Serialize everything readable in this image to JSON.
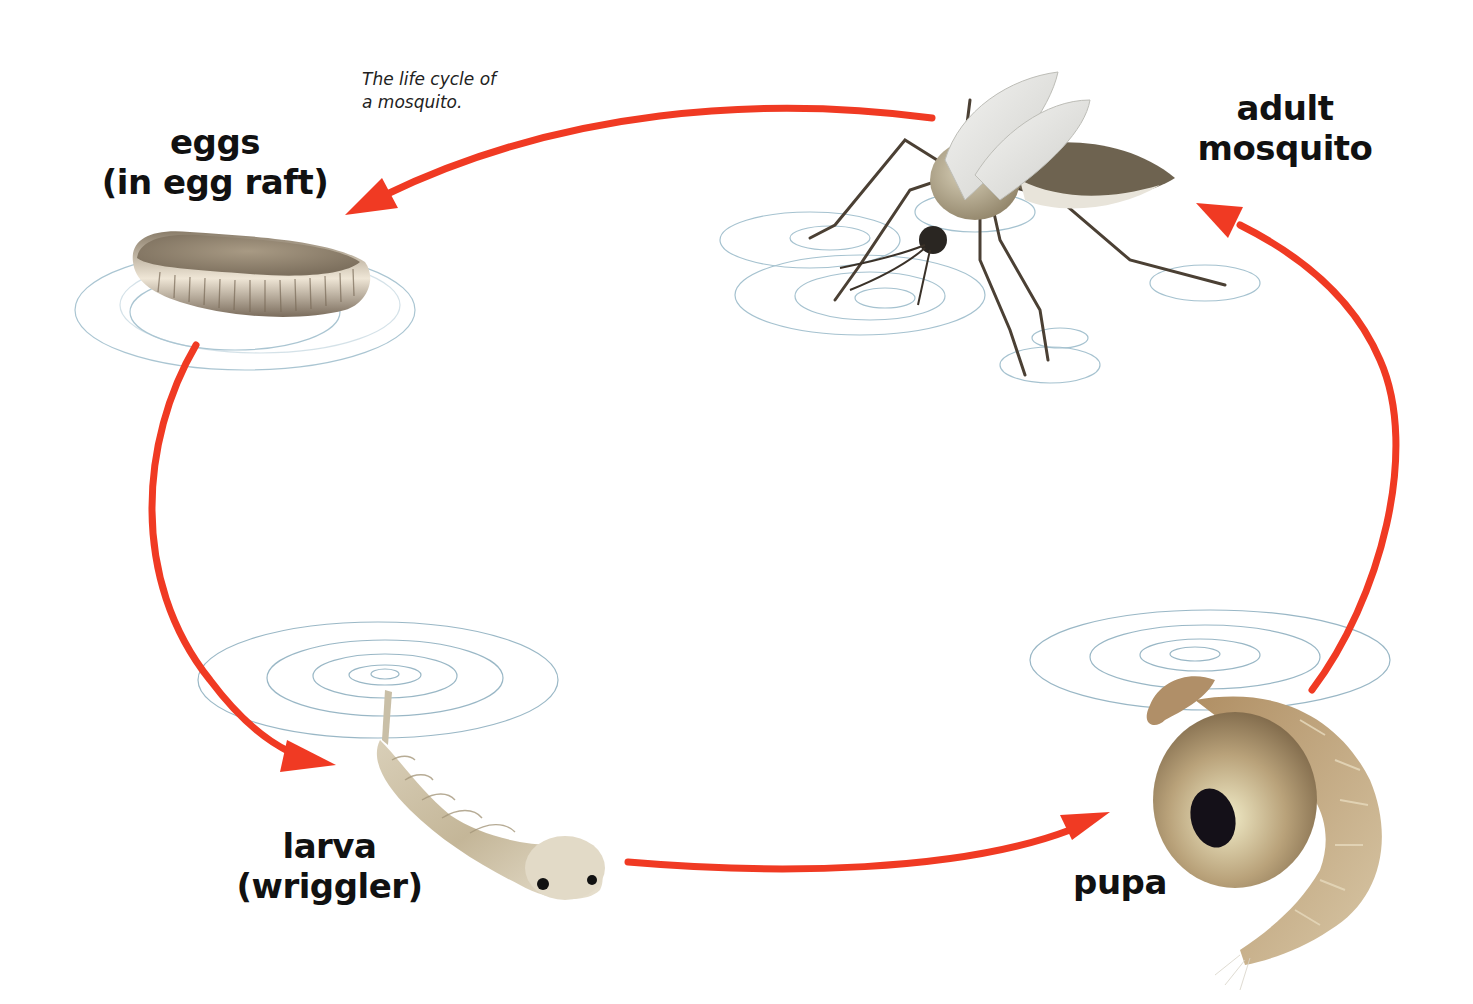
{
  "diagram": {
    "title": "The life cycle of a mosquito.",
    "caption_lines": [
      "The life cycle of",
      "a mosquito."
    ],
    "arrow_color": "#f03a23",
    "ripple_color": "#8fb3c4",
    "stages": [
      {
        "id": "eggs",
        "lines": [
          "eggs",
          "(in egg raft)"
        ]
      },
      {
        "id": "larva",
        "lines": [
          "larva",
          "(wriggler)"
        ]
      },
      {
        "id": "pupa",
        "lines": [
          "pupa"
        ]
      },
      {
        "id": "adult",
        "lines": [
          "adult",
          "mosquito"
        ]
      }
    ],
    "flow": [
      {
        "from": "adult",
        "to": "eggs"
      },
      {
        "from": "eggs",
        "to": "larva"
      },
      {
        "from": "larva",
        "to": "pupa"
      },
      {
        "from": "pupa",
        "to": "adult"
      }
    ]
  }
}
